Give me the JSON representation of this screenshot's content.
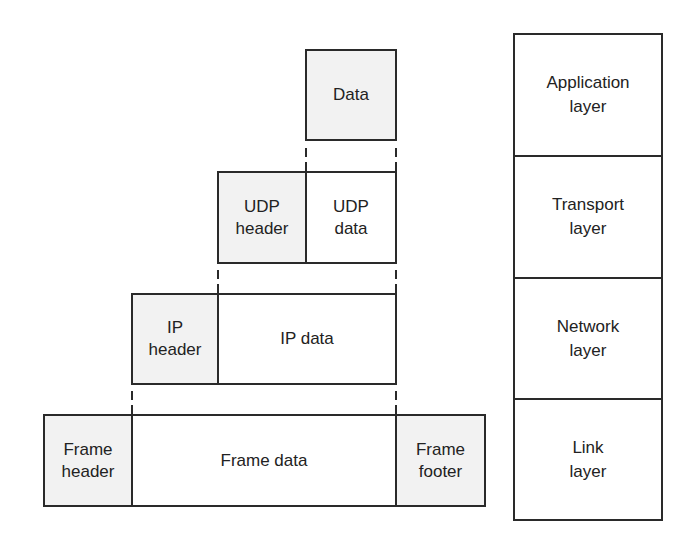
{
  "diagram": {
    "colors": {
      "line": "#2a2a2a",
      "header_fill": "#f2f2f2",
      "data_fill": "#ffffff",
      "text": "#222222"
    },
    "encapsulation": {
      "application": {
        "data": "Data"
      },
      "transport": {
        "header": "UDP\nheader",
        "data": "UDP\ndata"
      },
      "network": {
        "header": "IP\nheader",
        "data": "IP data"
      },
      "link": {
        "header": "Frame\nheader",
        "data": "Frame data",
        "footer": "Frame\nfooter"
      }
    },
    "layers": [
      {
        "label": "Application\nlayer"
      },
      {
        "label": "Transport\nlayer"
      },
      {
        "label": "Network\nlayer"
      },
      {
        "label": "Link\nlayer"
      }
    ]
  }
}
